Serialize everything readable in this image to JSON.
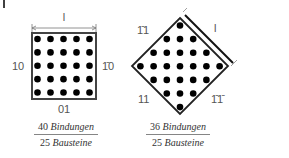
{
  "figure": {
    "corner_mark": "|",
    "square": {
      "dimension_label": "l",
      "left_label": "10",
      "right_label": "1̄0",
      "bottom_label": "01",
      "grid": {
        "rows": 5,
        "cols": 5
      },
      "caption": {
        "numerator_count": "40",
        "numerator_word": "Bindungen",
        "denominator_count": "25",
        "denominator_word": "Bausteine"
      }
    },
    "diamond": {
      "dimension_label": "l",
      "top_left_label": "1̄1",
      "bottom_left_label": "11",
      "bottom_right_label": "1̄1̄",
      "row_counts": [
        1,
        3,
        5,
        7,
        5,
        3,
        1
      ],
      "caption": {
        "numerator_count": "36",
        "numerator_word": "Bindungen",
        "denominator_count": "25",
        "denominator_word": "Bausteine"
      }
    },
    "colors": {
      "border": "#333333",
      "dots": "#000000",
      "labels": "#555555"
    }
  }
}
